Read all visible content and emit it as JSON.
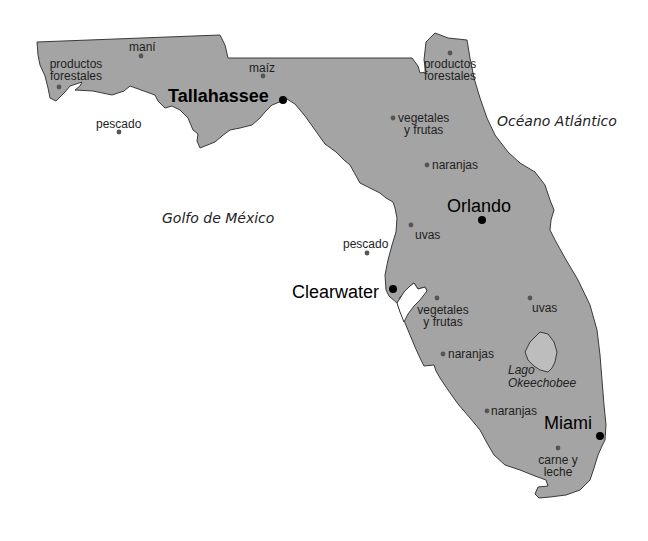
{
  "map": {
    "title": "Florida products map",
    "colors": {
      "land": "#a4a4a4",
      "lake": "#bdbdbd",
      "outline": "#3a3a3a",
      "dot": "#555555",
      "city_dot": "#000000",
      "background": "#ffffff"
    }
  },
  "water_bodies": [
    {
      "name": "Golfo de México"
    },
    {
      "name": "Océano Atlántico"
    },
    {
      "name_line1": "Lago",
      "name_line2": "Okeechobee"
    }
  ],
  "cities": [
    {
      "name": "Tallahassee"
    },
    {
      "name": "Orlando"
    },
    {
      "name": "Clearwater"
    },
    {
      "name": "Miami"
    }
  ],
  "products": [
    {
      "line1": "productos",
      "line2": "forestales"
    },
    {
      "line1": "maní"
    },
    {
      "line1": "maíz"
    },
    {
      "line1": "pescado"
    },
    {
      "line1": "productos",
      "line2": "forestales"
    },
    {
      "line1": "vegetales",
      "line2": "y frutas"
    },
    {
      "line1": "naranjas"
    },
    {
      "line1": "uvas"
    },
    {
      "line1": "pescado"
    },
    {
      "line1": "vegetales",
      "line2": "y frutas"
    },
    {
      "line1": "uvas"
    },
    {
      "line1": "naranjas"
    },
    {
      "line1": "naranjas"
    },
    {
      "line1": "carne y",
      "line2": "leche"
    }
  ]
}
